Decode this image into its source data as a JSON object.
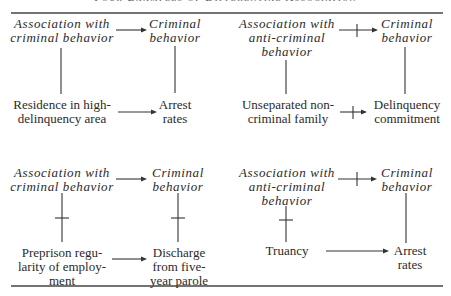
{
  "title": "Four Examples of Differential Association",
  "diagrams": [
    {
      "id": "top-left",
      "nodes": {
        "concept_a": "Association with\ncriminal behavior",
        "concept_b": "Criminal\nbehavior",
        "indicator_a": "Residence in high-\ndelinquency area",
        "indicator_b": "Arrest\nrates"
      },
      "links": {
        "concept_arrow": "positive",
        "indicator_arrow": "positive",
        "left_link": "positive",
        "right_link": "positive"
      }
    },
    {
      "id": "top-right",
      "nodes": {
        "concept_a": "Association with\nanti-criminal\nbehavior",
        "concept_b": "Criminal\nbehavior",
        "indicator_a": "Unseparated non-\ncriminal family",
        "indicator_b": "Delinquency\ncommitment"
      },
      "links": {
        "concept_arrow": "negative",
        "indicator_arrow": "negative",
        "left_link": "positive",
        "right_link": "positive"
      }
    },
    {
      "id": "bottom-left",
      "nodes": {
        "concept_a": "Association with\ncriminal behavior",
        "concept_b": "Criminal\nbehavior",
        "indicator_a": "Preprison regu-\nlarity of employ-\nment",
        "indicator_b": "Discharge\nfrom five-\nyear parole"
      },
      "links": {
        "concept_arrow": "positive",
        "indicator_arrow": "positive",
        "left_link": "negative",
        "right_link": "negative"
      }
    },
    {
      "id": "bottom-right",
      "nodes": {
        "concept_a": "Association with\nanti-criminal\nbehavior",
        "concept_b": "Criminal\nbehavior",
        "indicator_a": "Truancy",
        "indicator_b": "Arrest\nrates"
      },
      "links": {
        "concept_arrow": "negative",
        "indicator_arrow": "positive",
        "left_link": "negative",
        "right_link": "positive"
      }
    }
  ],
  "legend": {
    "plain_line_or_arrow": "positive relationship",
    "crossed_line_or_arrow": "negative relationship"
  }
}
